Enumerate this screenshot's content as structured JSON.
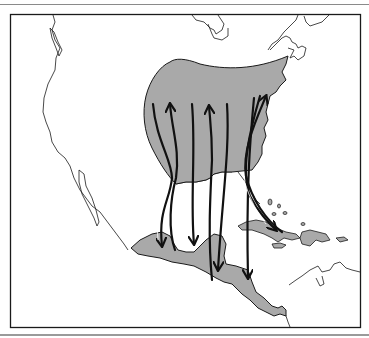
{
  "figure": {
    "type": "migration-route-map",
    "region": "Eastern North America, Gulf of Mexico, Central America, Caribbean",
    "colors": {
      "land_outline": "#1a1a1a",
      "range_fill": "#a9a9a9",
      "arrow": "#111111",
      "background": "#ffffff",
      "frame": "#1a1a1a"
    },
    "legend": [],
    "labels": [],
    "shaded_areas": [
      {
        "name": "breeding-range",
        "description": "Eastern United States"
      },
      {
        "name": "wintering-range-mexico",
        "description": "Southern Mexico / Yucatan"
      },
      {
        "name": "wintering-range-central-america",
        "description": "Central America"
      },
      {
        "name": "wintering-range-caribbean",
        "description": "Greater Antilles islands"
      }
    ],
    "routes": [
      {
        "id": 1,
        "direction": "southbound",
        "from": "eastern US",
        "to": "southern Mexico"
      },
      {
        "id": 2,
        "direction": "northbound",
        "from": "southern Mexico",
        "to": "eastern US"
      },
      {
        "id": 3,
        "direction": "southbound",
        "from": "eastern US",
        "to": "Yucatan"
      },
      {
        "id": 4,
        "direction": "northbound",
        "from": "Central America",
        "to": "eastern US"
      },
      {
        "id": 5,
        "direction": "southbound",
        "from": "eastern US",
        "to": "Central America"
      },
      {
        "id": 6,
        "direction": "southbound",
        "from": "Atlantic coast",
        "to": "Nicaragua"
      },
      {
        "id": 7,
        "direction": "southbound",
        "from": "Atlantic coast",
        "to": "Hispaniola/Cuba"
      },
      {
        "id": 8,
        "direction": "northbound",
        "from": "Cuba",
        "to": "Atlantic coast"
      }
    ]
  }
}
